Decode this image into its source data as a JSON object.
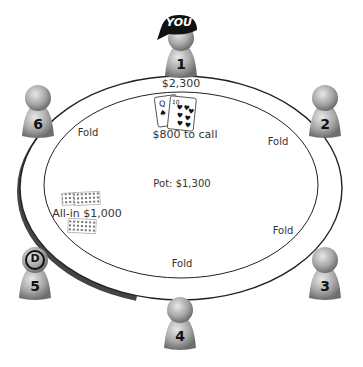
{
  "table": {
    "pot": "Pot: $1,300",
    "colors": {
      "rim": "#222222",
      "felt": "#ffffff",
      "shadow": "#444444"
    }
  },
  "hero": {
    "seat": "1",
    "badge": "YOU",
    "stack": "$2,300",
    "action": "$800 to call",
    "cards": [
      {
        "rank": "Q",
        "suit": "spades",
        "glyph": "♠"
      },
      {
        "rank": "10",
        "suit": "hearts",
        "glyph": "♥"
      }
    ]
  },
  "seats": [
    {
      "number": "1",
      "status": ""
    },
    {
      "number": "2",
      "status": "Fold"
    },
    {
      "number": "3",
      "status": "Fold"
    },
    {
      "number": "4",
      "status": "Fold"
    },
    {
      "number": "5",
      "status": "All-in $1,000",
      "dealer": "D"
    },
    {
      "number": "6",
      "status": "Fold"
    }
  ]
}
